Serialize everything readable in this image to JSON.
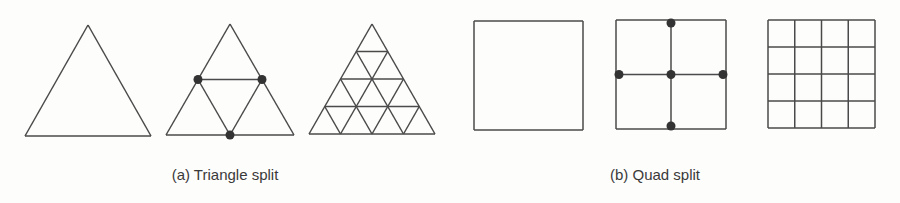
{
  "figure": {
    "line_color": "#4a4a4a",
    "dot_color": "#333333",
    "background": "#fdfdfc",
    "triangle_panel": {
      "caption": "(a) Triangle split",
      "stages": [
        {
          "name": "original",
          "subdivisions": 1,
          "split_points": 0
        },
        {
          "name": "first-split",
          "subdivisions": 2,
          "split_points": 3
        },
        {
          "name": "refined",
          "subdivisions": 4,
          "split_points": 0
        }
      ]
    },
    "quad_panel": {
      "caption": "(b) Quad split",
      "stages": [
        {
          "name": "original",
          "subdivisions": 1,
          "split_points": 0
        },
        {
          "name": "first-split",
          "subdivisions": 2,
          "split_points": 5
        },
        {
          "name": "refined",
          "subdivisions": 4,
          "split_points": 0
        }
      ]
    }
  }
}
